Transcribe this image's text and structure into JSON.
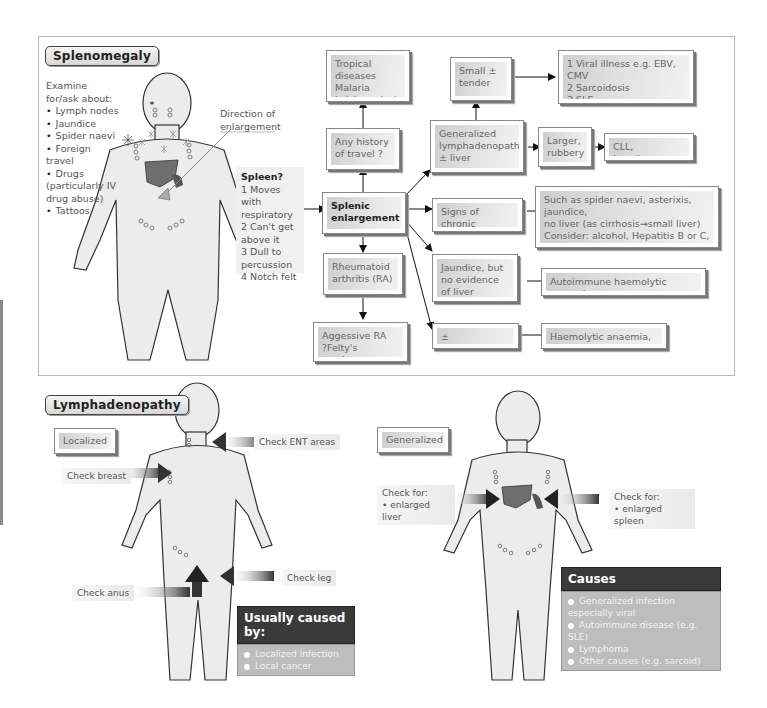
{
  "splenomegaly": {
    "title": "Splenomegaly",
    "examine_heading": "Examine for/ask about:",
    "examine_items": [
      "Lymph nodes",
      "Jaundice",
      "Spider naevi",
      "Foreign travel",
      "Drugs (particularly IV drug abuse)",
      "Tattoos"
    ],
    "direction_label": "Direction of enlargement",
    "spleen_panel": {
      "title": "Spleen?",
      "items": [
        "1 Moves with respiratory",
        "2 Can't get above it",
        "3 Dull to percussion",
        "4 Notch felt"
      ]
    },
    "flowchart": {
      "center": "Splenic\nenlargement",
      "tropical": "Tropical diseases\nMalaria\nLeishmaniasis",
      "travel": "Any history\nof travel ?",
      "ra": "Rheumatoid\narthritis (RA)",
      "aggressive_ra": "Aggessive RA\n?Felty's syndrome",
      "generalized": "Generalized\nlymphadenopathy\n± liver",
      "small_tender": "Small ±\ntender",
      "viral": "1 Viral illness e.g. EBV, CMV\n2 Sarcoidosis\n3 SLE",
      "larger": "Larger,\nrubbery",
      "cll": "CLL, lymphoma",
      "chronic_liver": "Signs of chronic\nliver disease",
      "spider": "Such as spider naevi, asterixis, jaundice,\nno liver (as cirrhosis→small liver)\nConsider: alcohol, Hepatitis B or C,\nautoimmune chronic active hepatitis",
      "jaundice": "Jaundice, but\nno evidence\nof liver disease",
      "autoimmune": "Autoimmune haemolytic anaemia",
      "hepatomegaly": "± Hepatomegaly",
      "haemolytic": "Haemolytic anaemia, CML"
    }
  },
  "lymphadenopathy": {
    "title": "Lymphadenopathy",
    "localized": {
      "label": "Localized",
      "check_ent": "Check ENT areas",
      "check_breast": "Check breast",
      "check_leg": "Check leg",
      "check_anus": "Check anus",
      "causes_title": "Usually caused by:",
      "causes": [
        "Localized infection",
        "Local cancer"
      ]
    },
    "generalized": {
      "label": "Generalized",
      "check_liver_title": "Check for:",
      "check_liver_item": "enlarged liver",
      "check_spleen_title": "Check for:",
      "check_spleen_item": "enlarged spleen",
      "causes_title": "Causes",
      "causes": [
        "Generalized infection especially viral",
        "Autoimmune disease (e.g. SLE)",
        "Lymphoma",
        "Other causes (e.g. sarcoid)"
      ]
    }
  },
  "colors": {
    "organ": "#6e6e6e",
    "body_fill": "#ececec",
    "panel_border": "#b9b9b9",
    "dark_header": "#3a3a3a"
  }
}
